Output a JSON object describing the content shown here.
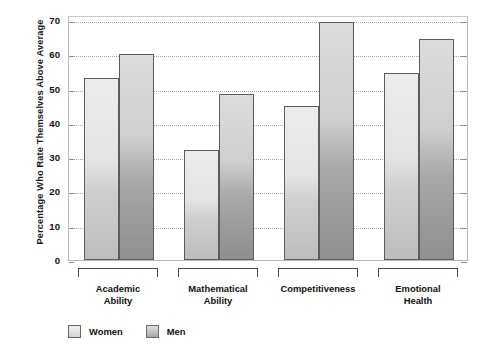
{
  "chart_data": {
    "type": "bar",
    "title": "",
    "xlabel": "",
    "ylabel": "Percentage Who Rate Themselves Above Average",
    "categories": [
      "Academic Ability",
      "Mathematical Ability",
      "Competitiveness",
      "Emotional Health"
    ],
    "category_lines": [
      [
        "Academic",
        "Ability"
      ],
      [
        "Mathematical",
        "Ability"
      ],
      [
        "Competitiveness",
        ""
      ],
      [
        "Emotional",
        "Health"
      ]
    ],
    "series": [
      {
        "name": "Women",
        "values": [
          53,
          32,
          45,
          54.5
        ],
        "color": "#e4e4e4"
      },
      {
        "name": "Men",
        "values": [
          60,
          48.5,
          69.5,
          64.5
        ],
        "color": "#b4b4b4"
      }
    ],
    "ylim": [
      0,
      70
    ],
    "yticks": [
      0,
      10,
      20,
      30,
      40,
      50,
      60,
      70
    ],
    "ytick_labels": [
      "0",
      "10",
      "20",
      "30",
      "40",
      "50",
      "60",
      "70"
    ],
    "grid": true,
    "legend_position": "bottom-left"
  },
  "legend": {
    "items": [
      {
        "label": "Women",
        "swatch": "women-swatch"
      },
      {
        "label": "Men",
        "swatch": "men-swatch"
      }
    ]
  }
}
